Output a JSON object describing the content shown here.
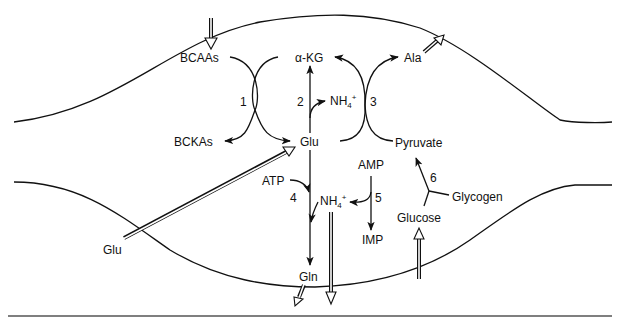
{
  "diagram": {
    "title": "",
    "labels": {
      "bcaas": "BCAAs",
      "bckas": "BCKAs",
      "akg": "α-KG",
      "glu_center": "Glu",
      "nh4_top": "NH4+",
      "ala": "Ala",
      "pyruvate": "Pyruvate",
      "atp": "ATP",
      "nh4_bottom": "NH4+",
      "amp": "AMP",
      "imp": "IMP",
      "glycogen": "Glycogen",
      "glucose": "Glucose",
      "glu_outside": "Glu",
      "gln": "Gln"
    },
    "reaction_numbers": {
      "r1": "1",
      "r2": "2",
      "r3": "3",
      "r4": "4",
      "r5": "5",
      "r6": "6"
    },
    "nodes": [
      "BCAAs",
      "BCKAs",
      "α-KG",
      "Glu",
      "NH4+",
      "Ala",
      "Pyruvate",
      "ATP",
      "AMP",
      "IMP",
      "Glycogen",
      "Glucose",
      "Gln"
    ],
    "edges": [
      {
        "from": "BCAAs",
        "to": "BCKAs",
        "reaction": "1"
      },
      {
        "from": "α-KG",
        "to": "Glu",
        "reaction": "1"
      },
      {
        "from": "Glu",
        "to": "α-KG",
        "reaction": "2"
      },
      {
        "from": "Glu",
        "to": "NH4+",
        "reaction": "2"
      },
      {
        "from": "Glu",
        "to": "α-KG",
        "reaction": "3"
      },
      {
        "from": "Pyruvate",
        "to": "Ala",
        "reaction": "3"
      },
      {
        "from": "Glu",
        "to": "Gln",
        "reaction": "4",
        "cofactor": "ATP"
      },
      {
        "from": "NH4+",
        "to": "Gln",
        "reaction": "4"
      },
      {
        "from": "AMP",
        "to": "IMP",
        "reaction": "5"
      },
      {
        "from": "AMP",
        "to": "NH4+",
        "reaction": "5"
      },
      {
        "from": "Glycogen",
        "to": "Pyruvate",
        "reaction": "6"
      },
      {
        "from": "Glucose",
        "to": "Pyruvate",
        "reaction": "6"
      }
    ],
    "transport": [
      {
        "species": "BCAAs",
        "direction": "in"
      },
      {
        "species": "Ala",
        "direction": "out"
      },
      {
        "species": "Glu",
        "direction": "in"
      },
      {
        "species": "Gln",
        "direction": "out"
      },
      {
        "species": "NH4+",
        "direction": "out"
      },
      {
        "species": "Glucose",
        "direction": "in"
      }
    ],
    "colors": {
      "ink": "#111111",
      "background": "#ffffff",
      "rule": "#555555"
    }
  }
}
